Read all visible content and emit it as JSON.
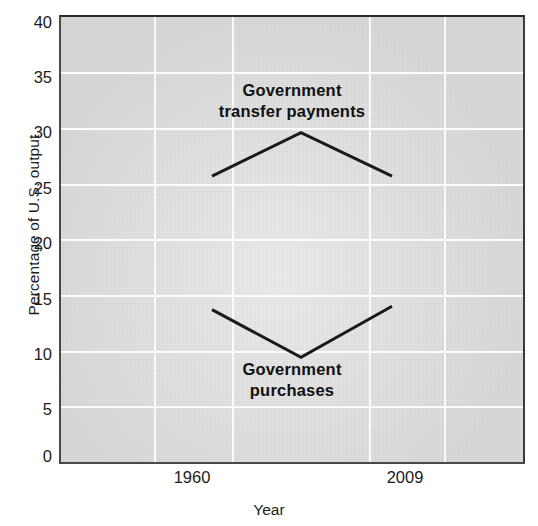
{
  "chart_data": {
    "type": "line",
    "title": "",
    "xlabel": "Year",
    "ylabel": "Percentage of U.S. output",
    "x": [
      "1960",
      "1985",
      "2009"
    ],
    "xtick_labels": [
      "1960",
      "2009"
    ],
    "ytick_labels": [
      "0",
      "5",
      "10",
      "15",
      "20",
      "25",
      "30",
      "35",
      "40"
    ],
    "ylim": [
      0,
      40
    ],
    "ytick_step": 5,
    "grid": true,
    "legend": "none",
    "series": [
      {
        "name": "Government transfer payments",
        "values": [
          25.7,
          29.6,
          25.7
        ],
        "annotation": "Government\ntransfer payments"
      },
      {
        "name": "Government purchases",
        "values": [
          13.7,
          9.4,
          14.0
        ],
        "annotation": "Government\npurchases"
      }
    ],
    "colors": {
      "line": "#1a1a1a",
      "plot_background": "#e4e4e4",
      "gridline": "#ffffff",
      "axis": "#3a3a3a",
      "text": "#1c1c1c"
    }
  },
  "axes": {
    "y_title": "Percentage of U.S. output",
    "x_title": "Year",
    "y_ticks": [
      {
        "label": "40",
        "value": 40
      },
      {
        "label": "35",
        "value": 35
      },
      {
        "label": "30",
        "value": 30
      },
      {
        "label": "25",
        "value": 25
      },
      {
        "label": "20",
        "value": 20
      },
      {
        "label": "15",
        "value": 15
      },
      {
        "label": "10",
        "value": 10
      },
      {
        "label": "5",
        "value": 5
      },
      {
        "label": "0",
        "value": 0
      }
    ],
    "x_ticks": [
      {
        "label": "1960"
      },
      {
        "label": "2009"
      }
    ]
  },
  "annotations": [
    {
      "id": "transfer",
      "line1": "Government",
      "line2": "transfer payments"
    },
    {
      "id": "purchases",
      "line1": "Government",
      "line2": "purchases"
    }
  ]
}
